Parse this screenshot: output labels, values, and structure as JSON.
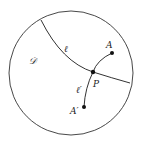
{
  "diagram": {
    "type": "hyperbolic-disk",
    "colors": {
      "stroke": "#333333",
      "point": "#111111",
      "background": "#ffffff"
    },
    "disk": {
      "label": "𝒟",
      "cx": 71,
      "cy": 73,
      "r": 62
    },
    "geodesic_l": {
      "label": "ℓ"
    },
    "geodesic_l_prime": {
      "label": "ℓ′"
    },
    "points": {
      "A": {
        "label": "A",
        "x": 112,
        "y": 53
      },
      "P": {
        "label": "P",
        "x": 93,
        "y": 72
      },
      "A_prime": {
        "label": "A′",
        "x": 84,
        "y": 107
      }
    }
  }
}
